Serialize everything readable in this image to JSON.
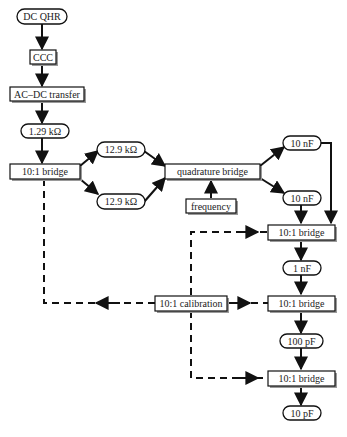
{
  "diagram": {
    "colors": {
      "stroke": "#111111",
      "fill": "#ffffff",
      "shadow": "#9a9a9a",
      "text": "#222222"
    },
    "nodes": {
      "dc_qhr": {
        "label": "DC QHR",
        "shape": "ellipse"
      },
      "ccc": {
        "label": "CCC",
        "shape": "box"
      },
      "ac_dc_transfer": {
        "label": "AC–DC transfer",
        "shape": "box"
      },
      "r_1_29k": {
        "label": "1.29 kΩ",
        "shape": "ellipse"
      },
      "bridge_left": {
        "label": "10:1 bridge",
        "shape": "box"
      },
      "r_12_9k_top": {
        "label": "12.9 kΩ",
        "shape": "ellipse"
      },
      "r_12_9k_bottom": {
        "label": "12.9 kΩ",
        "shape": "ellipse"
      },
      "quadrature_bridge": {
        "label": "quadrature bridge",
        "shape": "box"
      },
      "frequency": {
        "label": "frequency",
        "shape": "box"
      },
      "c_10nf_top": {
        "label": "10 nF",
        "shape": "ellipse"
      },
      "c_10nf_bottom": {
        "label": "10 nF",
        "shape": "ellipse"
      },
      "bridge_right_1": {
        "label": "10:1 bridge",
        "shape": "box"
      },
      "c_1nf": {
        "label": "1 nF",
        "shape": "ellipse"
      },
      "calibration": {
        "label": "10:1 calibration",
        "shape": "box"
      },
      "bridge_right_2": {
        "label": "10:1 bridge",
        "shape": "box"
      },
      "c_100pf": {
        "label": "100 pF",
        "shape": "ellipse"
      },
      "bridge_right_3": {
        "label": "10:1 bridge",
        "shape": "box"
      },
      "c_10pf": {
        "label": "10 pF",
        "shape": "ellipse"
      }
    },
    "edges": [
      {
        "from": "DC QHR",
        "to": "CCC",
        "style": "solid"
      },
      {
        "from": "CCC",
        "to": "AC–DC transfer",
        "style": "solid"
      },
      {
        "from": "AC–DC transfer",
        "to": "1.29 kΩ",
        "style": "solid"
      },
      {
        "from": "1.29 kΩ",
        "to": "10:1 bridge",
        "style": "solid"
      },
      {
        "from": "10:1 bridge",
        "to": "12.9 kΩ (top)",
        "style": "solid"
      },
      {
        "from": "10:1 bridge",
        "to": "12.9 kΩ (bottom)",
        "style": "solid"
      },
      {
        "from": "12.9 kΩ (top)",
        "to": "quadrature bridge",
        "style": "solid"
      },
      {
        "from": "12.9 kΩ (bottom)",
        "to": "quadrature bridge",
        "style": "solid"
      },
      {
        "from": "frequency",
        "to": "quadrature bridge",
        "style": "solid"
      },
      {
        "from": "quadrature bridge",
        "to": "10 nF (top)",
        "style": "solid"
      },
      {
        "from": "quadrature bridge",
        "to": "10 nF (bottom)",
        "style": "solid"
      },
      {
        "from": "10 nF (top)",
        "to": "10:1 bridge (1)",
        "style": "solid"
      },
      {
        "from": "10 nF (bottom)",
        "to": "10:1 bridge (1)",
        "style": "solid"
      },
      {
        "from": "10:1 bridge (1)",
        "to": "1 nF",
        "style": "solid"
      },
      {
        "from": "1 nF",
        "to": "10:1 bridge (2)",
        "style": "solid"
      },
      {
        "from": "10:1 bridge (2)",
        "to": "100 pF",
        "style": "solid"
      },
      {
        "from": "100 pF",
        "to": "10:1 bridge (3)",
        "style": "solid"
      },
      {
        "from": "10:1 bridge (3)",
        "to": "10 pF",
        "style": "solid"
      },
      {
        "from": "10:1 calibration",
        "to": "10:1 bridge (left)",
        "style": "dashed"
      },
      {
        "from": "10:1 calibration",
        "to": "10:1 bridge (1)",
        "style": "dashed"
      },
      {
        "from": "10:1 calibration",
        "to": "10:1 bridge (2)",
        "style": "dashed"
      },
      {
        "from": "10:1 calibration",
        "to": "10:1 bridge (3)",
        "style": "dashed"
      }
    ]
  }
}
